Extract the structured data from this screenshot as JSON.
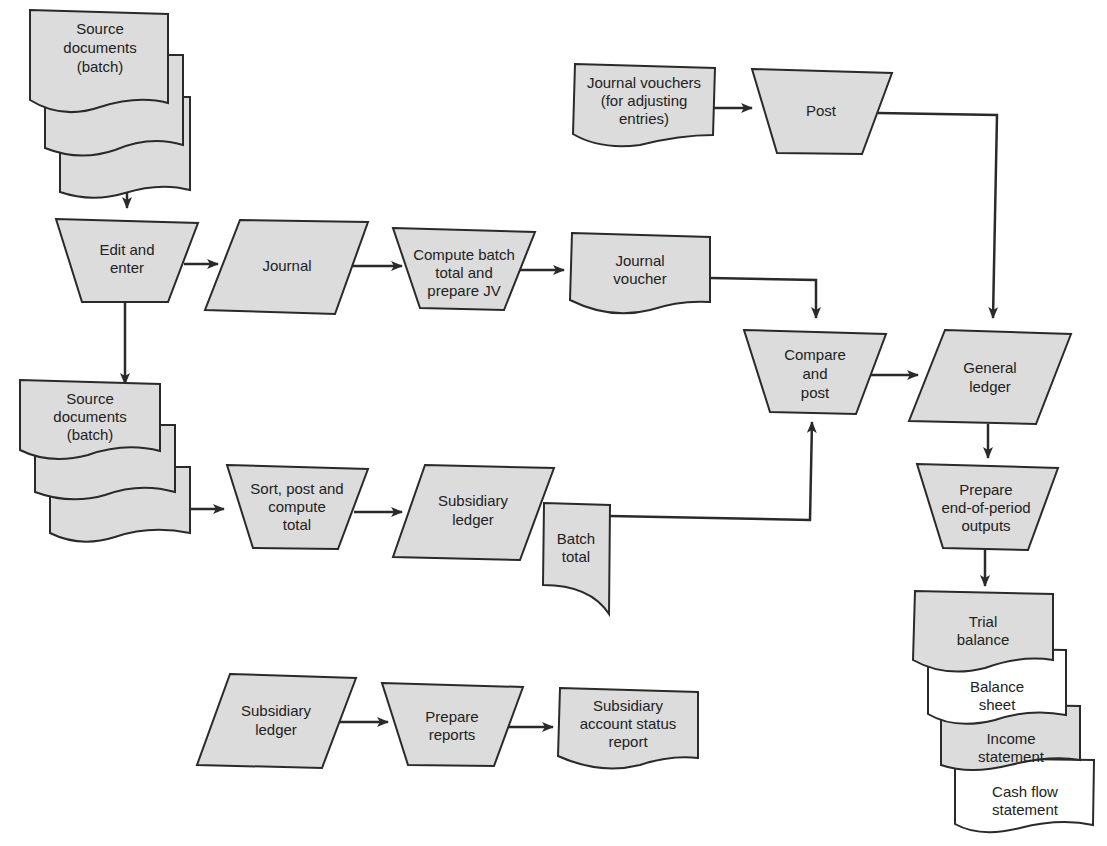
{
  "colors": {
    "fill": "#dcdcdc",
    "stroke": "#2a2a2a",
    "background": "#ffffff"
  },
  "nodes": {
    "source_docs_top": {
      "type": "multi-document",
      "lines": [
        "Source",
        "documents",
        "(batch)"
      ]
    },
    "edit_enter": {
      "type": "manual-operation",
      "lines": [
        "Edit and",
        "enter"
      ]
    },
    "journal": {
      "type": "data-io",
      "lines": [
        "Journal"
      ]
    },
    "compute_batch": {
      "type": "manual-operation",
      "lines": [
        "Compute batch",
        "total and",
        "prepare JV"
      ]
    },
    "journal_voucher": {
      "type": "document",
      "lines": [
        "Journal",
        "voucher"
      ]
    },
    "jv_adjusting": {
      "type": "document",
      "lines": [
        "Journal vouchers",
        "(for adjusting",
        "entries)"
      ]
    },
    "post": {
      "type": "manual-operation",
      "lines": [
        "Post"
      ]
    },
    "compare_post": {
      "type": "manual-operation",
      "lines": [
        "Compare",
        "and",
        "post"
      ]
    },
    "general_ledger": {
      "type": "data-io",
      "lines": [
        "General",
        "ledger"
      ]
    },
    "source_docs_bottom": {
      "type": "multi-document",
      "lines": [
        "Source",
        "documents",
        "(batch)"
      ]
    },
    "sort_post": {
      "type": "manual-operation",
      "lines": [
        "Sort, post and",
        "compute",
        "total"
      ]
    },
    "subsidiary_ledger_1": {
      "type": "data-io",
      "lines": [
        "Subsidiary",
        "ledger"
      ]
    },
    "batch_total": {
      "type": "card",
      "lines": [
        "Batch",
        "total"
      ]
    },
    "prepare_eop": {
      "type": "manual-operation",
      "lines": [
        "Prepare",
        "end-of-period",
        "outputs"
      ]
    },
    "trial_balance": {
      "type": "document",
      "lines": [
        "Trial",
        "balance"
      ]
    },
    "balance_sheet": {
      "type": "document",
      "lines": [
        "Balance",
        "sheet"
      ]
    },
    "income_statement": {
      "type": "document",
      "lines": [
        "Income",
        "statement"
      ]
    },
    "cash_flow": {
      "type": "document",
      "lines": [
        "Cash flow",
        "statement"
      ]
    },
    "subsidiary_ledger_2": {
      "type": "data-io",
      "lines": [
        "Subsidiary",
        "ledger"
      ]
    },
    "prepare_reports": {
      "type": "manual-operation",
      "lines": [
        "Prepare",
        "reports"
      ]
    },
    "sub_status_report": {
      "type": "document",
      "lines": [
        "Subsidiary",
        "account status",
        "report"
      ]
    }
  },
  "edges": [
    [
      "source_docs_top",
      "edit_enter"
    ],
    [
      "edit_enter",
      "journal"
    ],
    [
      "journal",
      "compute_batch"
    ],
    [
      "compute_batch",
      "journal_voucher"
    ],
    [
      "journal_voucher",
      "compare_post"
    ],
    [
      "jv_adjusting",
      "post"
    ],
    [
      "post",
      "general_ledger"
    ],
    [
      "edit_enter",
      "source_docs_bottom"
    ],
    [
      "source_docs_bottom",
      "sort_post"
    ],
    [
      "sort_post",
      "subsidiary_ledger_1"
    ],
    [
      "batch_total",
      "compare_post"
    ],
    [
      "compare_post",
      "general_ledger"
    ],
    [
      "general_ledger",
      "prepare_eop"
    ],
    [
      "prepare_eop",
      "trial_balance"
    ],
    [
      "subsidiary_ledger_2",
      "prepare_reports"
    ],
    [
      "prepare_reports",
      "sub_status_report"
    ]
  ]
}
